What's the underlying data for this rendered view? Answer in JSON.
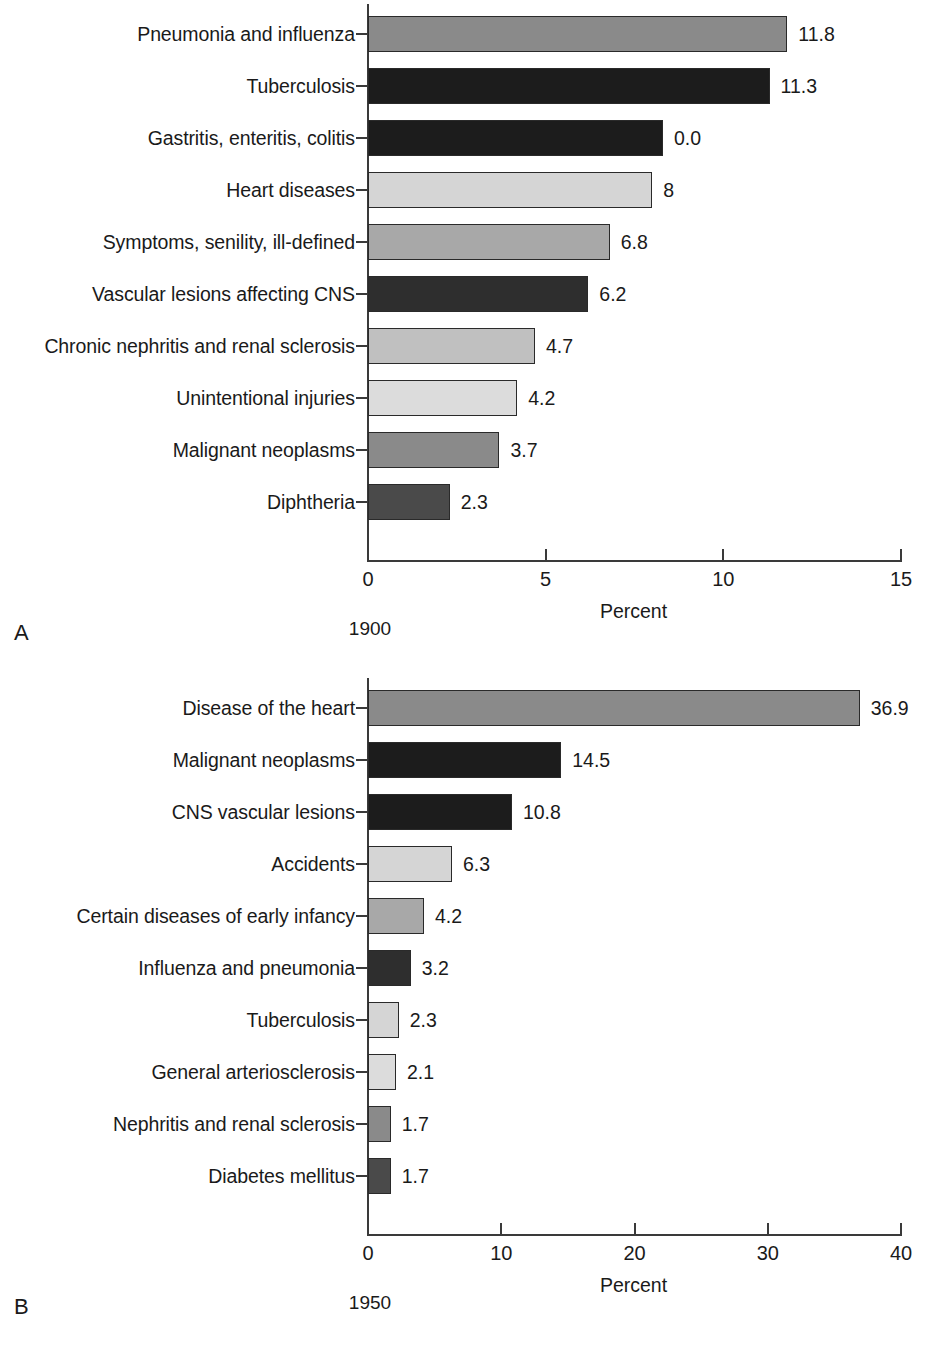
{
  "figure": {
    "panels": [
      {
        "letter": "A",
        "year": "1900",
        "axis_title": "Percent",
        "tick_labels": [
          "0",
          "5",
          "10",
          "15"
        ]
      },
      {
        "letter": "B",
        "year": "1950",
        "axis_title": "Percent",
        "tick_labels": [
          "0",
          "10",
          "20",
          "30",
          "40"
        ]
      }
    ]
  },
  "chart_data": [
    {
      "type": "bar",
      "orientation": "horizontal",
      "panel": "A",
      "title": "1900",
      "xlabel": "Percent",
      "ylabel": "",
      "xlim": [
        0,
        15
      ],
      "xticks": [
        0,
        5,
        10,
        15
      ],
      "grid": false,
      "legend": "none",
      "categories": [
        "Pneumonia and influenza",
        "Tuberculosis",
        "Gastritis, enteritis, colitis",
        "Heart diseases",
        "Symptoms, senility, ill-defined",
        "Vascular lesions affecting CNS",
        "Chronic nephritis and renal sclerosis",
        "Unintentional injuries",
        "Malignant neoplasms",
        "Diphtheria"
      ],
      "values": [
        11.8,
        11.3,
        8.3,
        8.0,
        6.8,
        6.2,
        4.7,
        4.2,
        3.7,
        2.3
      ],
      "value_labels": [
        "11.8",
        "11.3",
        "0.0",
        "8",
        "6.8",
        "6.2",
        "4.7",
        "4.2",
        "3.7",
        "2.3"
      ],
      "bar_colors": [
        "#8a8a8a",
        "#1c1c1c",
        "#1c1c1c",
        "#d5d5d5",
        "#a8a8a8",
        "#2e2e2e",
        "#c0c0c0",
        "#dcdcdc",
        "#8a8a8a",
        "#4a4a4a"
      ]
    },
    {
      "type": "bar",
      "orientation": "horizontal",
      "panel": "B",
      "title": "1950",
      "xlabel": "Percent",
      "ylabel": "",
      "xlim": [
        0,
        40
      ],
      "xticks": [
        0,
        10,
        20,
        30,
        40
      ],
      "grid": false,
      "legend": "none",
      "categories": [
        "Disease of the heart",
        "Malignant neoplasms",
        "CNS vascular lesions",
        "Accidents",
        "Certain diseases of early infancy",
        "Influenza and pneumonia",
        "Tuberculosis",
        "General arteriosclerosis",
        "Nephritis and renal sclerosis",
        "Diabetes mellitus"
      ],
      "values": [
        36.9,
        14.5,
        10.8,
        6.3,
        4.2,
        3.2,
        2.3,
        2.1,
        1.7,
        1.7
      ],
      "value_labels": [
        "36.9",
        "14.5",
        "10.8",
        "6.3",
        "4.2",
        "3.2",
        "2.3",
        "2.1",
        "1.7",
        "1.7"
      ],
      "bar_colors": [
        "#8a8a8a",
        "#1c1c1c",
        "#1c1c1c",
        "#d5d5d5",
        "#a8a8a8",
        "#2e2e2e",
        "#d5d5d5",
        "#dcdcdc",
        "#8a8a8a",
        "#4a4a4a"
      ]
    }
  ]
}
